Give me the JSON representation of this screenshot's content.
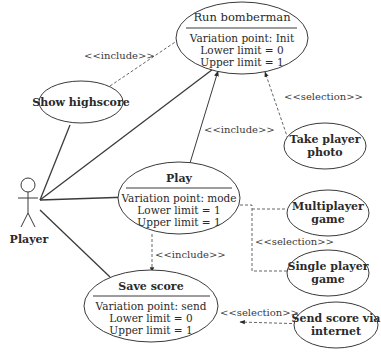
{
  "diagram": {
    "type": "uml-use-case",
    "actor": {
      "label": "Player"
    },
    "use_cases": {
      "run_bomberman": {
        "title": "Run bomberman",
        "lines": [
          "Variation point: Init",
          "Lower limit = 0",
          "Upper limit = 1"
        ]
      },
      "show_highscore": {
        "title": "Show highscore"
      },
      "take_player_photo": {
        "line1": "Take player",
        "line2": "photo"
      },
      "play": {
        "title": "Play",
        "lines": [
          "Variation point: mode",
          "Lower limit = 1",
          "Upper limit = 1"
        ]
      },
      "multiplayer_game": {
        "line1": "Multiplayer",
        "line2": "game"
      },
      "single_player_game": {
        "line1": "Single player",
        "line2": "game"
      },
      "save_score": {
        "title": "Save score",
        "lines": [
          "Variation point: send",
          "Lower limit = 0",
          "Upper limit = 1"
        ]
      },
      "send_score_via_internet": {
        "line1": "Send score via",
        "line2": "internet"
      }
    },
    "relations": {
      "highscore_include": "<<include>>",
      "play_include_run": "<<include>>",
      "photo_selection": "<<selection>>",
      "mode_selection": "<<selection>>",
      "play_include_save": "<<include>>",
      "send_selection": "<<selection>>"
    }
  }
}
